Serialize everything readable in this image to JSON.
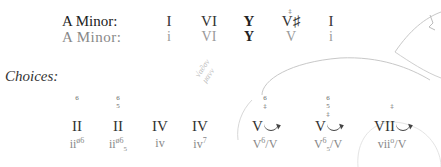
{
  "header": {
    "key_major_label": "A Minor:",
    "key_minor_label": "A Minor:",
    "row1": [
      "I",
      "VI",
      "Y",
      "V♯",
      "I"
    ],
    "row2": [
      "i",
      "VI",
      "Y",
      "V",
      "i"
    ],
    "row1_marks": [
      "",
      "",
      "",
      "‡",
      ""
    ]
  },
  "choices": {
    "label": "Choices:",
    "items": [
      {
        "fig_top": "6",
        "fig_mid": "",
        "roman": "II",
        "lower": "ii",
        "lower_sup": "ø6",
        "lower_sub": "",
        "arrow": false
      },
      {
        "fig_top": "6",
        "fig_mid": "5",
        "roman": "II",
        "lower": "ii",
        "lower_sup": "ø6",
        "lower_sub": "5",
        "arrow": false
      },
      {
        "fig_top": "",
        "fig_mid": "",
        "roman": "IV",
        "lower": "iv",
        "lower_sup": "",
        "lower_sub": "",
        "arrow": false
      },
      {
        "fig_top": "",
        "fig_mid": "",
        "roman": "IV",
        "lower": "iv",
        "lower_sup": "7",
        "lower_sub": "",
        "arrow": false
      },
      {
        "fig_top": "6",
        "fig_mid": "‡",
        "roman": "V",
        "lower": "V",
        "lower_sup": "6",
        "lower_sub": "",
        "lower_tail": "/V",
        "arrow": true
      },
      {
        "fig_top": "6",
        "fig_mid": "5",
        "fig_low": "‡",
        "roman": "V",
        "lower": "V",
        "lower_sup": "6",
        "lower_sub": "5",
        "lower_tail": "/V",
        "arrow": true
      },
      {
        "fig_top": "",
        "fig_mid": "‡",
        "roman": "VII",
        "lower": "vii",
        "lower_sup": "o",
        "lower_sub": "",
        "lower_tail": "/V",
        "arrow": true
      }
    ]
  },
  "annotation": {
    "scribble_line1": "√α∂σν",
    "scribble_line2": "μανν"
  }
}
